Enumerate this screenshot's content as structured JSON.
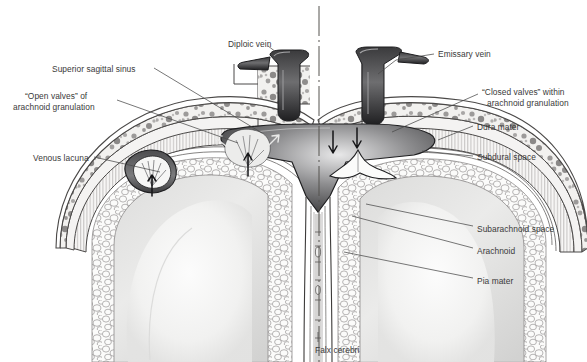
{
  "figure": {
    "background_color": "#ffffff",
    "text_color": "#3a3a3a",
    "leader_line_color": "#4a4a4a",
    "midline_axis": "dash-dot vertical centerline",
    "labels": [
      {
        "id": "diploic-vein",
        "text": "Diploic vein",
        "x": 228,
        "y": 39,
        "align": "left"
      },
      {
        "id": "emissary-vein",
        "text": "Emissary vein",
        "x": 438,
        "y": 49,
        "align": "left"
      },
      {
        "id": "superior-sagittal-sinus",
        "text": "Superior sagittal sinus",
        "x": 52,
        "y": 64,
        "align": "left"
      },
      {
        "id": "open-valves",
        "text": "“Open valves” of",
        "x": 25,
        "y": 91,
        "align": "left"
      },
      {
        "id": "open-valves-line2",
        "text": "arachnoid granulation",
        "x": 13,
        "y": 102,
        "align": "left"
      },
      {
        "id": "closed-valves",
        "text": "“Closed valves” within",
        "x": 482,
        "y": 87,
        "align": "left"
      },
      {
        "id": "closed-valves-line2",
        "text": "arachnoid granulation",
        "x": 487,
        "y": 98,
        "align": "left"
      },
      {
        "id": "dura-mater",
        "text": "Dura mater",
        "x": 477,
        "y": 122,
        "align": "left"
      },
      {
        "id": "subdural-space",
        "text": "Subdural space",
        "x": 477,
        "y": 152,
        "align": "left"
      },
      {
        "id": "venous-lacuna",
        "text": "Venous lacuna",
        "x": 33,
        "y": 153,
        "align": "left"
      },
      {
        "id": "subarachnoid-space",
        "text": "Subarachnoid space",
        "x": 477,
        "y": 224,
        "align": "left"
      },
      {
        "id": "arachnoid",
        "text": "Arachnoid",
        "x": 477,
        "y": 246,
        "align": "left"
      },
      {
        "id": "pia-mater",
        "text": "Pia mater",
        "x": 477,
        "y": 276,
        "align": "left"
      },
      {
        "id": "falx-cerebri",
        "text": "Falx cerebri",
        "x": 315,
        "y": 345,
        "align": "center"
      }
    ],
    "structures": [
      "skull diploe with mottled cancellous bone",
      "superior sagittal sinus lumen",
      "dura mater with vertical striations",
      "subarachnoid space trabecular mesh",
      "cerebral hemispheres gray and white matter",
      "falx cerebri midline septum",
      "venous lacuna with open-valve arachnoid granulation",
      "closed-valve arachnoid granulation",
      "diploic vein",
      "emissary vein"
    ],
    "flow_arrows": {
      "open_valve_direction": "up (CSF into sinus)",
      "closed_valve_direction": "down (blocked)",
      "count": 4
    }
  }
}
